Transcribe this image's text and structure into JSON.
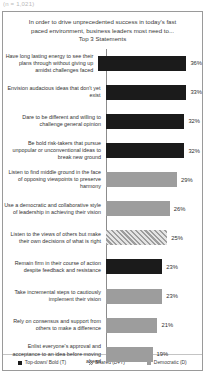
{
  "top_clip_text": "(n = 1,021)",
  "chart_data": {
    "type": "bar",
    "orientation": "horizontal",
    "title": "In order to drive unprecedented success in today's fast paced environment, business leaders most need to... Top 3 Statements",
    "title_lines": [
      "In order to drive unprecedented success in today's fast",
      "paced environment, business leaders most need to...",
      "Top 3 Statements"
    ],
    "xlabel": "",
    "ylabel": "",
    "xlim": [
      0,
      40
    ],
    "grid": false,
    "legend_position": "bottom",
    "categories": [
      "Have long lasting energy to see their plans through without giving up amidst challenges faced",
      "Envision audacious ideas that don't yet exist",
      "Dare to be different and willing to challenge  general opinion",
      "Be bold risk-takers  that pursue unpopular or unconventional ideas to break new ground",
      "Listen to find middle ground in the face of opposing viewpoints  to preserve harmony",
      "Use a democratic and collaborative style of leadership  in achieving their vision",
      "Listen to the views of others but make their own decisions of what is right",
      "Remain firm in their course of action despite feedback and resistance",
      "Take incremental steps to cautiously implement their vision",
      "Rely on consensus and support from others to make a difference",
      "Enlist everyone's approval and acceptance to an idea before moving ahead"
    ],
    "values": [
      36,
      33,
      32,
      32,
      29,
      26,
      25,
      23,
      23,
      21,
      19
    ],
    "value_labels": [
      "36%",
      "33%",
      "32%",
      "32%",
      "29%",
      "26%",
      "25%",
      "23%",
      "23%",
      "21%",
      "19%"
    ],
    "styles": [
      "dark",
      "dark",
      "dark",
      "dark",
      "gray",
      "gray",
      "hatch",
      "dark",
      "gray",
      "gray",
      "gray"
    ],
    "series_of_bar": [
      "Top-down/ Bold (T)",
      "Top-down/ Bold (T)",
      "Top-down/ Bold (T)",
      "Top-down/ Bold (T)",
      "Democratic (D)",
      "Democratic (D)",
      "Shared (D+T)",
      "Top-down/ Bold (T)",
      "Democratic (D)",
      "Democratic (D)",
      "Democratic (D)"
    ],
    "legend": [
      {
        "label": "Top-down/ Bold (T)",
        "style": "dark",
        "color": "#1b1b1b"
      },
      {
        "label": "Shared (D+T)",
        "style": "hatch",
        "color": "#c9c9c9"
      },
      {
        "label": "Democratic (D)",
        "style": "gray",
        "color": "#9d9d9d"
      }
    ]
  }
}
